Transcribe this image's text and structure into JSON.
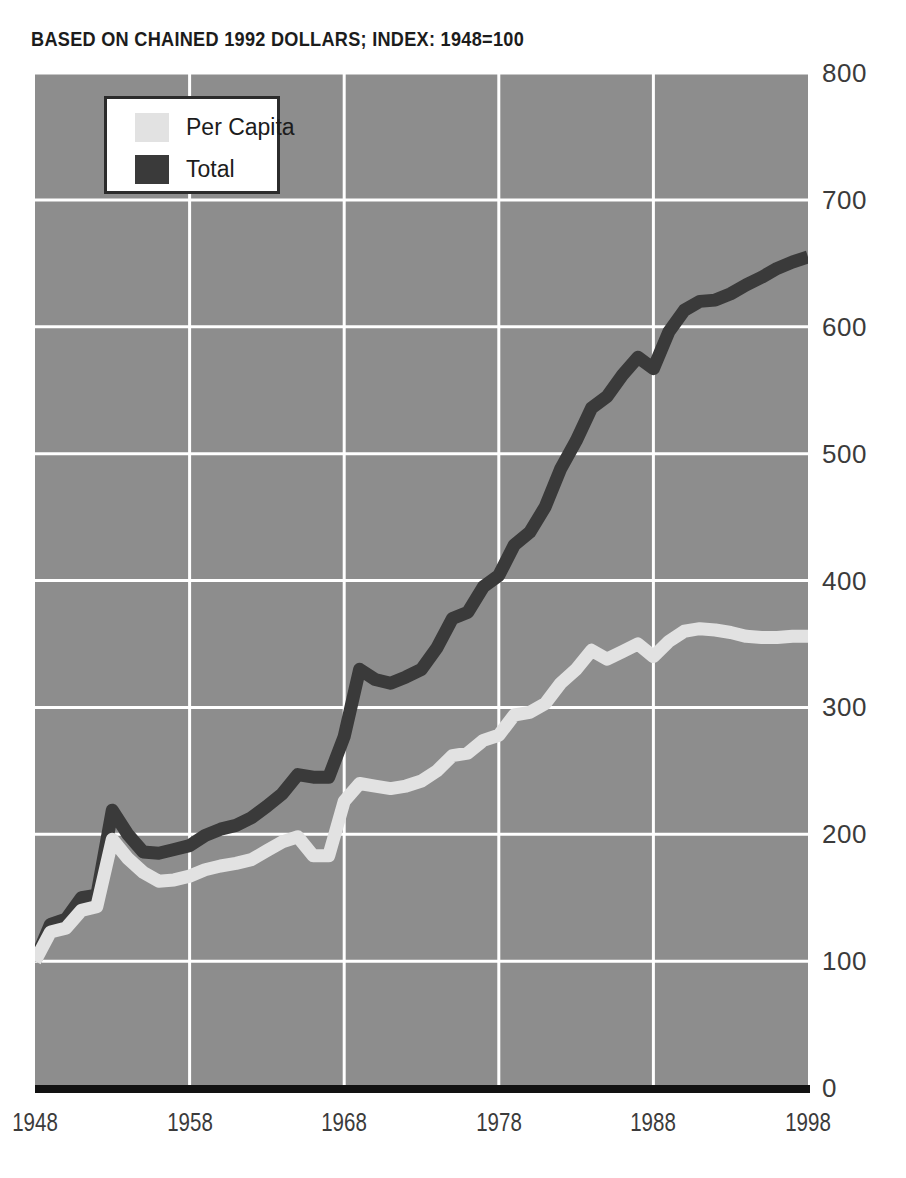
{
  "subtitle": "BASED ON CHAINED 1992 DOLLARS; INDEX: 1948=100",
  "clipped_header": "·",
  "colors": {
    "plot_background": "#8d8d8d",
    "gridline": "#ffffff",
    "axis": "#111111",
    "per_capita": "#e2e2e2",
    "total": "#3a3a3a",
    "tick_text": "#3b3b3b",
    "title_text": "#1c1c1c"
  },
  "legend": {
    "items": [
      {
        "label": "Per Capita",
        "color": "#e2e2e2"
      },
      {
        "label": "Total",
        "color": "#3a3a3a"
      }
    ]
  },
  "axes": {
    "y_ticks": [
      "800",
      "700",
      "600",
      "500",
      "400",
      "300",
      "200",
      "100",
      "0"
    ],
    "x_ticks": [
      "1948",
      "1958",
      "1968",
      "1978",
      "1988",
      "1998"
    ]
  },
  "chart_data": {
    "type": "line",
    "title": "",
    "subtitle": "BASED ON CHAINED 1992 DOLLARS; INDEX: 1948=100",
    "xlabel": "",
    "ylabel": "",
    "xlim": [
      1948,
      1998
    ],
    "ylim": [
      0,
      800
    ],
    "x_ticks": [
      1948,
      1958,
      1968,
      1978,
      1988,
      1998
    ],
    "y_ticks": [
      0,
      100,
      200,
      300,
      400,
      500,
      600,
      700,
      800
    ],
    "grid": true,
    "legend_position": "top-left",
    "x": [
      1948,
      1949,
      1950,
      1951,
      1952,
      1953,
      1954,
      1955,
      1956,
      1957,
      1958,
      1959,
      1960,
      1961,
      1962,
      1963,
      1964,
      1965,
      1966,
      1967,
      1968,
      1969,
      1970,
      1971,
      1972,
      1973,
      1974,
      1975,
      1976,
      1977,
      1978,
      1979,
      1980,
      1981,
      1982,
      1983,
      1984,
      1985,
      1986,
      1987,
      1988,
      1989,
      1990,
      1991,
      1992,
      1993,
      1994,
      1995,
      1996,
      1997,
      1998
    ],
    "series": [
      {
        "name": "Total",
        "color": "#3a3a3a",
        "values": [
          100,
          129,
          133,
          150,
          152,
          219,
          200,
          186,
          185,
          188,
          191,
          199,
          204,
          207,
          213,
          222,
          232,
          247,
          245,
          245,
          277,
          330,
          322,
          319,
          324,
          330,
          347,
          370,
          375,
          395,
          404,
          428,
          438,
          458,
          488,
          510,
          536,
          545,
          562,
          576,
          567,
          596,
          613,
          620,
          621,
          626,
          633,
          639,
          646,
          651,
          655
        ]
      },
      {
        "name": "Per Capita",
        "color": "#e2e2e2",
        "values": [
          100,
          123,
          126,
          140,
          143,
          196,
          181,
          170,
          163,
          164,
          167,
          172,
          175,
          177,
          180,
          187,
          194,
          198,
          183,
          183,
          226,
          240,
          238,
          236,
          238,
          242,
          250,
          262,
          264,
          274,
          278,
          294,
          296,
          303,
          319,
          330,
          345,
          338,
          344,
          350,
          340,
          352,
          360,
          362,
          361,
          359,
          356,
          355,
          355,
          356,
          356
        ]
      }
    ]
  }
}
